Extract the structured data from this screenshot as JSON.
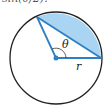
{
  "caption": "sin(θ/2).",
  "figure": {
    "type": "circular-segment",
    "labels": {
      "angle": "θ",
      "radius": "r"
    },
    "colors": {
      "circle": "#222222",
      "lines": "#2f7fc4",
      "fill": "#a9d4f2"
    }
  }
}
